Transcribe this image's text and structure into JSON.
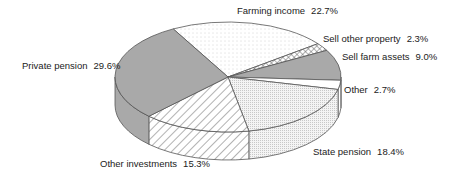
{
  "chart_data": {
    "type": "pie",
    "style": "3d",
    "title": "",
    "categories": [
      "Farming income",
      "Sell other property",
      "Sell farm assets",
      "Other",
      "State pension",
      "Other investments",
      "Private pension"
    ],
    "values": [
      22.7,
      2.3,
      9.0,
      2.7,
      18.4,
      15.3,
      29.6
    ],
    "unit": "%",
    "labels": [
      {
        "name": "Farming income",
        "pct": "22.7%"
      },
      {
        "name": "Sell other property",
        "pct": "2.3%"
      },
      {
        "name": "Sell farm assets",
        "pct": "9.0%"
      },
      {
        "name": "Other",
        "pct": "2.7%"
      },
      {
        "name": "State pension",
        "pct": "18.4%"
      },
      {
        "name": "Other investments",
        "pct": "15.3%"
      },
      {
        "name": "Private pension",
        "pct": "29.6%"
      }
    ],
    "fills": [
      "dots-light",
      "crosshatch",
      "gray",
      "white",
      "fine-dots",
      "diagonal-hatch",
      "gray"
    ],
    "colors": {
      "gray": "#a9a9a9",
      "outline": "#555555",
      "text": "#222222"
    }
  }
}
